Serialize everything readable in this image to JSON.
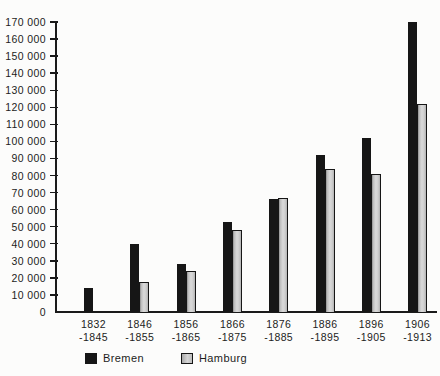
{
  "chart_data": {
    "type": "bar",
    "title": "",
    "xlabel": "",
    "ylabel": "",
    "grid": false,
    "legend_position": "bottom",
    "ylim": [
      0,
      170000
    ],
    "ytick_step": 10000,
    "yticks": [
      {
        "value": 170000,
        "label": "170 000"
      },
      {
        "value": 160000,
        "label": "160 000"
      },
      {
        "value": 150000,
        "label": "150 000"
      },
      {
        "value": 140000,
        "label": "140 000"
      },
      {
        "value": 130000,
        "label": "130 000"
      },
      {
        "value": 120000,
        "label": "120 000"
      },
      {
        "value": 110000,
        "label": "110 000"
      },
      {
        "value": 100000,
        "label": "100 000"
      },
      {
        "value": 90000,
        "label": "90 000"
      },
      {
        "value": 80000,
        "label": "80 000"
      },
      {
        "value": 70000,
        "label": "70 000"
      },
      {
        "value": 60000,
        "label": "60 000"
      },
      {
        "value": 50000,
        "label": "50 000"
      },
      {
        "value": 40000,
        "label": "40 000"
      },
      {
        "value": 30000,
        "label": "30 000"
      },
      {
        "value": 20000,
        "label": "20 000"
      },
      {
        "value": 10000,
        "label": "10 000"
      },
      {
        "value": 0,
        "label": "0"
      }
    ],
    "categories": [
      {
        "line1": "1832",
        "line2": "-1845"
      },
      {
        "line1": "1846",
        "line2": "-1855"
      },
      {
        "line1": "1856",
        "line2": "-1865"
      },
      {
        "line1": "1866",
        "line2": "-1875"
      },
      {
        "line1": "1876",
        "line2": "-1885"
      },
      {
        "line1": "1886",
        "line2": "-1895"
      },
      {
        "line1": "1896",
        "line2": "-1905"
      },
      {
        "line1": "1906",
        "line2": "-1913"
      }
    ],
    "series": [
      {
        "name": "Bremen",
        "color": "#161616",
        "values": [
          14000,
          40000,
          28000,
          53000,
          66000,
          92000,
          102000,
          170000
        ]
      },
      {
        "name": "Hamburg",
        "color": "#cccccc",
        "values": [
          null,
          17500,
          24000,
          48000,
          67000,
          84000,
          81000,
          122000
        ]
      }
    ]
  }
}
